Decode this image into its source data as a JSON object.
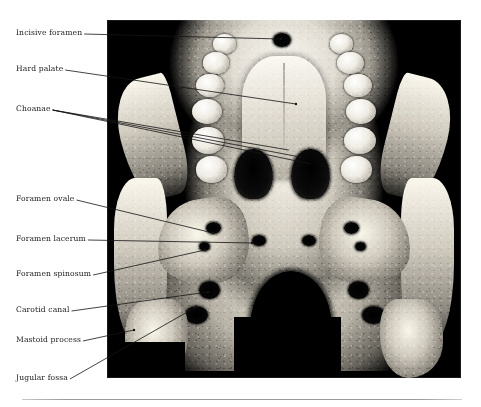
{
  "figure": {
    "type": "medical-ct-figure",
    "modality": "3D CT reconstruction",
    "view": "Skull base, inferior (basal) view",
    "image_panel": {
      "x": 107,
      "y": 20,
      "width": 354,
      "height": 358,
      "background": "#000000"
    },
    "rule": {
      "x": 22,
      "y": 399,
      "width": 440,
      "color": "#9a9a9a"
    },
    "text_color": "#1b1b1b"
  },
  "labels": [
    {
      "id": "incisive-foramen",
      "text": "Incisive foramen",
      "x": 16,
      "y": 29,
      "tip_x": 281,
      "tip_y": 39,
      "leaders": 1
    },
    {
      "id": "hard-palate",
      "text": "Hard palate",
      "x": 16,
      "y": 65,
      "tip_x": 296,
      "tip_y": 104,
      "leaders": 1
    },
    {
      "id": "choanae",
      "text": "Choanae",
      "x": 16,
      "y": 105,
      "tip_x": 300,
      "tip_y": 157,
      "leaders": 3
    },
    {
      "id": "foramen-ovale",
      "text": "Foramen ovale",
      "x": 16,
      "y": 195,
      "tip_x": 213,
      "tip_y": 233,
      "leaders": 1
    },
    {
      "id": "foramen-lacerum",
      "text": "Foramen lacerum",
      "x": 16,
      "y": 235,
      "tip_x": 252,
      "tip_y": 243,
      "leaders": 1
    },
    {
      "id": "foramen-spinosum",
      "text": "Foramen spinosum",
      "x": 16,
      "y": 270,
      "tip_x": 205,
      "tip_y": 250,
      "leaders": 1
    },
    {
      "id": "carotid-canal",
      "text": "Carotid canal",
      "x": 16,
      "y": 306,
      "tip_x": 208,
      "tip_y": 292,
      "leaders": 1
    },
    {
      "id": "mastoid-process",
      "text": "Mastoid process",
      "x": 16,
      "y": 336,
      "tip_x": 134,
      "tip_y": 330,
      "leaders": 1
    },
    {
      "id": "jugular-fossa",
      "text": "Jugular fossa",
      "x": 16,
      "y": 374,
      "tip_x": 196,
      "tip_y": 307,
      "leaders": 1
    }
  ]
}
